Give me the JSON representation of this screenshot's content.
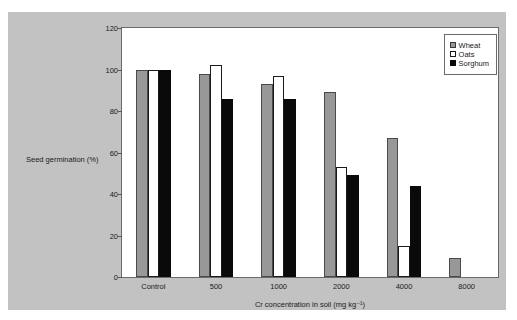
{
  "chart_data": {
    "type": "bar",
    "title": "",
    "xlabel": "Cr concentration in soil (mg kg⁻¹)",
    "ylabel": "Seed germination (%)",
    "categories": [
      "Control",
      "500",
      "1000",
      "2000",
      "4000",
      "8000"
    ],
    "series": [
      {
        "name": "Wheat",
        "color": "#989898",
        "values": [
          100,
          98,
          93,
          89,
          67,
          9
        ]
      },
      {
        "name": "Oats",
        "color": "#ffffff",
        "values": [
          100,
          102,
          97,
          53,
          15,
          null
        ]
      },
      {
        "name": "Sorghum",
        "color": "#0a0a0a",
        "values": [
          100,
          86,
          86,
          49,
          44,
          null
        ]
      }
    ],
    "ylim": [
      0,
      120
    ],
    "yticks": [
      0,
      20,
      40,
      60,
      80,
      100,
      120
    ],
    "ytick_labels": [
      "0",
      "20",
      "40",
      "60",
      "80",
      "100",
      "120"
    ],
    "grid": false,
    "legend_position": "top-right",
    "legend_entries": [
      "Wheat",
      "Oats",
      "Sorghum"
    ]
  },
  "axes": {
    "y_title": "Seed germination (%)",
    "x_title": "Cr concentration in soil (mg kg⁻¹)"
  }
}
